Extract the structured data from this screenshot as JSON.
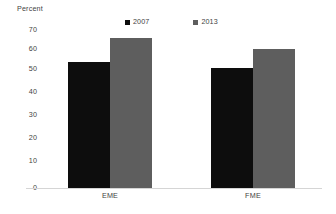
{
  "chart_data": {
    "type": "bar",
    "title": "",
    "subtitle": "",
    "xlabel": "",
    "ylabel": "Percent",
    "categories": [
      "EME",
      "FME"
    ],
    "series": [
      {
        "name": "2007",
        "color": "#0d0d0d",
        "values": [
          55.5,
          52.8
        ]
      },
      {
        "name": "2013",
        "color": "#5e5e5e",
        "values": [
          66.0,
          61.0
        ]
      }
    ],
    "ylim": [
      0,
      70
    ],
    "ytick_labels": [
      "0",
      "10",
      "20",
      "30",
      "40",
      "50",
      "60",
      "70"
    ],
    "ytick_values": [
      0,
      10,
      20,
      30,
      40,
      50,
      60,
      70
    ],
    "grid": false,
    "legend_position": "top-center",
    "annotations": []
  },
  "axis": {
    "y_title": "Percent"
  },
  "legend": {
    "entries": [
      {
        "label": "2007",
        "swatch_color": "#0d0d0d"
      },
      {
        "label": "2013",
        "swatch_color": "#5e5e5e"
      }
    ]
  },
  "ticks": {
    "y": [
      {
        "label": "70"
      },
      {
        "label": "60"
      },
      {
        "label": "50"
      },
      {
        "label": "40"
      },
      {
        "label": "30"
      },
      {
        "label": "20"
      },
      {
        "label": "10"
      },
      {
        "label": "0"
      }
    ]
  },
  "groups": [
    {
      "label": "EME"
    },
    {
      "label": "FME"
    }
  ],
  "colors": {
    "series_2007": "#0d0d0d",
    "series_2013": "#5e5e5e",
    "axis_line": "#d5d5d5",
    "text": "#3f3f3f",
    "background": "#ffffff"
  }
}
